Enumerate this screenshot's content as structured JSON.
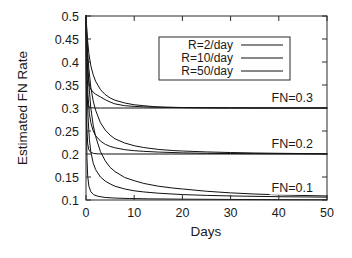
{
  "chart_data": {
    "type": "line",
    "title": "",
    "xlabel": "Days",
    "ylabel": "Estimated FN Rate",
    "xlim": [
      0,
      50
    ],
    "ylim": [
      0.1,
      0.5
    ],
    "grid": false,
    "xticks": [
      0,
      10,
      20,
      30,
      40,
      50
    ],
    "xtick_labels": [
      "0",
      "10",
      "20",
      "30",
      "40",
      "50"
    ],
    "yticks": [
      0.1,
      0.15,
      0.2,
      0.25,
      0.3,
      0.35,
      0.4,
      0.45,
      0.5
    ],
    "ytick_labels": [
      "0.1",
      "0.15",
      "0.2",
      "0.25",
      "0.3",
      "0.35",
      "0.4",
      "0.45",
      "0.5"
    ],
    "legend": {
      "position": "top-center-right",
      "entries": [
        "R=2/day",
        "R=10/day",
        "R=50/day"
      ]
    },
    "annotations": [
      {
        "text": "FN=0.3",
        "x": 38.5,
        "y": 0.312
      },
      {
        "text": "FN=0.2",
        "x": 38.5,
        "y": 0.212
      },
      {
        "text": "FN=0.1",
        "x": 38.5,
        "y": 0.118
      }
    ],
    "series": [
      {
        "name": "FN=0.3, R=2/day",
        "group": "FN=0.3",
        "rate": "R=2/day",
        "x": [
          0,
          0.3,
          0.6,
          1,
          1.5,
          2,
          3,
          4,
          5,
          6,
          8,
          10,
          12,
          14,
          16,
          18,
          20,
          25,
          30,
          35,
          40,
          45,
          50
        ],
        "y": [
          0.5,
          0.45,
          0.418,
          0.392,
          0.372,
          0.358,
          0.34,
          0.329,
          0.322,
          0.317,
          0.311,
          0.307,
          0.305,
          0.303,
          0.302,
          0.3015,
          0.301,
          0.3005,
          0.3002,
          0.3001,
          0.3,
          0.3,
          0.3
        ]
      },
      {
        "name": "FN=0.3, R=10/day",
        "group": "FN=0.3",
        "rate": "R=10/day",
        "x": [
          0,
          0.2,
          0.4,
          0.7,
          1,
          1.5,
          2,
          3,
          4,
          5,
          6,
          8,
          10,
          12,
          15,
          20,
          25,
          30,
          40,
          50
        ],
        "y": [
          0.5,
          0.408,
          0.372,
          0.35,
          0.341,
          0.334,
          0.33,
          0.324,
          0.318,
          0.313,
          0.309,
          0.305,
          0.3035,
          0.3025,
          0.3015,
          0.3008,
          0.3004,
          0.3002,
          0.3,
          0.3
        ]
      },
      {
        "name": "FN=0.3, R=50/day",
        "group": "FN=0.3",
        "rate": "R=50/day",
        "x": [
          0,
          0.1,
          0.2,
          0.35,
          0.6,
          1,
          2,
          3,
          5,
          8,
          12,
          20,
          30,
          40,
          50
        ],
        "y": [
          0.5,
          0.36,
          0.322,
          0.308,
          0.3025,
          0.3005,
          0.3,
          0.3,
          0.3,
          0.3,
          0.3,
          0.3,
          0.3,
          0.3,
          0.3
        ]
      },
      {
        "name": "FN=0.2, R=2/day",
        "group": "FN=0.2",
        "rate": "R=2/day",
        "x": [
          0,
          0.3,
          0.6,
          1,
          1.5,
          2,
          3,
          4,
          5,
          6,
          8,
          10,
          12,
          15,
          18,
          20,
          25,
          30,
          35,
          40,
          45,
          50
        ],
        "y": [
          0.5,
          0.43,
          0.385,
          0.345,
          0.315,
          0.295,
          0.268,
          0.252,
          0.241,
          0.233,
          0.224,
          0.218,
          0.214,
          0.21,
          0.2075,
          0.2065,
          0.2045,
          0.2032,
          0.2022,
          0.2015,
          0.201,
          0.2005
        ]
      },
      {
        "name": "FN=0.2, R=10/day",
        "group": "FN=0.2",
        "rate": "R=10/day",
        "x": [
          0,
          0.2,
          0.4,
          0.7,
          1,
          1.5,
          2,
          3,
          4,
          5,
          6,
          8,
          10,
          12,
          15,
          20,
          25,
          30,
          40,
          50
        ],
        "y": [
          0.5,
          0.385,
          0.33,
          0.288,
          0.268,
          0.25,
          0.24,
          0.228,
          0.221,
          0.2165,
          0.2135,
          0.2095,
          0.2072,
          0.2058,
          0.2042,
          0.2025,
          0.2015,
          0.201,
          0.2004,
          0.2
        ]
      },
      {
        "name": "FN=0.2, R=50/day",
        "group": "FN=0.2",
        "rate": "R=50/day",
        "x": [
          0,
          0.1,
          0.2,
          0.35,
          0.6,
          1,
          1.6,
          2.5,
          4,
          6,
          10,
          15,
          25,
          35,
          50
        ],
        "y": [
          0.5,
          0.315,
          0.252,
          0.222,
          0.209,
          0.2035,
          0.2012,
          0.2003,
          0.2,
          0.2,
          0.2,
          0.2,
          0.2,
          0.2,
          0.2
        ]
      },
      {
        "name": "FN=0.1, R=2/day",
        "group": "FN=0.1",
        "rate": "R=2/day",
        "x": [
          0,
          0.3,
          0.6,
          1,
          1.5,
          2,
          3,
          4,
          5,
          6,
          8,
          10,
          12,
          15,
          18,
          20,
          25,
          30,
          35,
          40,
          45,
          50
        ],
        "y": [
          0.5,
          0.41,
          0.352,
          0.3,
          0.262,
          0.238,
          0.205,
          0.185,
          0.171,
          0.162,
          0.149,
          0.142,
          0.136,
          0.13,
          0.126,
          0.124,
          0.119,
          0.1155,
          0.113,
          0.1112,
          0.1098,
          0.1088
        ]
      },
      {
        "name": "FN=0.1, R=10/day",
        "group": "FN=0.1",
        "rate": "R=10/day",
        "x": [
          0,
          0.2,
          0.4,
          0.7,
          1,
          1.5,
          2,
          3,
          4,
          5,
          6,
          8,
          10,
          12,
          15,
          20,
          25,
          30,
          40,
          50
        ],
        "y": [
          0.5,
          0.352,
          0.285,
          0.232,
          0.205,
          0.18,
          0.166,
          0.15,
          0.141,
          0.135,
          0.13,
          0.124,
          0.12,
          0.1175,
          0.1148,
          0.1118,
          0.11,
          0.1088,
          0.1072,
          0.1062
        ]
      },
      {
        "name": "FN=0.1, R=50/day",
        "group": "FN=0.1",
        "rate": "R=50/day",
        "x": [
          0,
          0.1,
          0.2,
          0.35,
          0.6,
          1,
          1.6,
          2.5,
          4,
          6,
          9,
          13,
          20,
          30,
          40,
          50
        ],
        "y": [
          0.5,
          0.262,
          0.192,
          0.152,
          0.13,
          0.118,
          0.1115,
          0.108,
          0.1055,
          0.1042,
          0.1032,
          0.1025,
          0.1018,
          0.1012,
          0.1008,
          0.1005
        ]
      }
    ]
  }
}
